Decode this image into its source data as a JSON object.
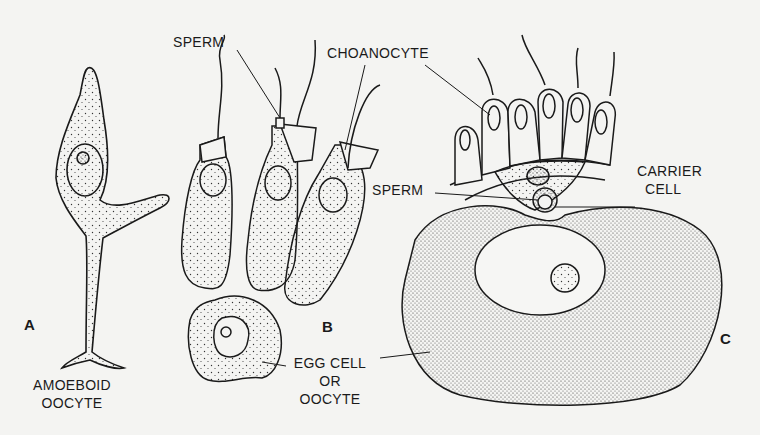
{
  "figure": {
    "panels": [
      {
        "id": "A",
        "label": "A",
        "caption": [
          "AMOEBOID",
          "OOCYTE"
        ]
      },
      {
        "id": "B",
        "label": "B",
        "labels": {
          "sperm": "SPERM",
          "choanocyte": "CHOANOCYTE",
          "egg": [
            "EGG CELL",
            "OR",
            "OOCYTE"
          ]
        }
      },
      {
        "id": "C",
        "label": "C",
        "labels": {
          "sperm": "SPERM",
          "carrier": [
            "CARRIER",
            "CELL"
          ]
        }
      }
    ]
  },
  "colors": {
    "background": "#f4f4f2",
    "ink": "#1a1a1a"
  }
}
